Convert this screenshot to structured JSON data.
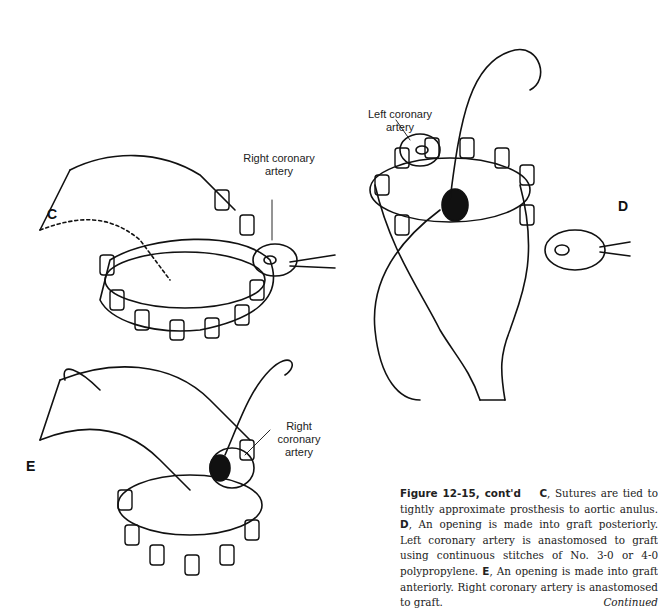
{
  "figure": {
    "panels": {
      "C": {
        "letter": "C",
        "labels": [
          "Right coronary",
          "artery"
        ]
      },
      "D": {
        "letter": "D",
        "labels": [
          "Left coronary",
          "artery"
        ]
      },
      "E": {
        "letter": "E",
        "labels": [
          "Right",
          "coronary",
          "artery"
        ]
      }
    },
    "caption": {
      "figure_label": "Figure 12-15, cont'd",
      "c_letter": "C",
      "c_text": ", Sutures are tied to tightly approximate prosthesis to aortic anulus. ",
      "d_letter": "D",
      "d_text": ", An opening is made into graft posteriorly. Left coronary artery is anastomosed to graft using continuous stitches of No. 3-0 or 4-0 polypropylene. ",
      "e_letter": "E",
      "e_text": ", An opening is made into graft anteriorly. Right coronary artery is anastomosed to graft.",
      "continued": "Continued"
    }
  }
}
